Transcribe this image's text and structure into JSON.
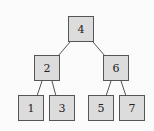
{
  "diagram": {
    "type": "binary-search-tree",
    "nodes": [
      {
        "id": "n4",
        "label": "4",
        "x": 68,
        "y": 16
      },
      {
        "id": "n2",
        "label": "2",
        "x": 34,
        "y": 55
      },
      {
        "id": "n6",
        "label": "6",
        "x": 103,
        "y": 55
      },
      {
        "id": "n1",
        "label": "1",
        "x": 18,
        "y": 95
      },
      {
        "id": "n3",
        "label": "3",
        "x": 49,
        "y": 95
      },
      {
        "id": "n5",
        "label": "5",
        "x": 88,
        "y": 95
      },
      {
        "id": "n7",
        "label": "7",
        "x": 119,
        "y": 95
      }
    ],
    "edges": [
      {
        "from": "4",
        "to": "2"
      },
      {
        "from": "4",
        "to": "6"
      },
      {
        "from": "2",
        "to": "1"
      },
      {
        "from": "2",
        "to": "3"
      },
      {
        "from": "6",
        "to": "5"
      },
      {
        "from": "6",
        "to": "7"
      }
    ],
    "colors": {
      "node_fill": "#dcdcdc",
      "node_border": "#555555",
      "edge": "#555555",
      "background": "#fbfbfb"
    }
  }
}
